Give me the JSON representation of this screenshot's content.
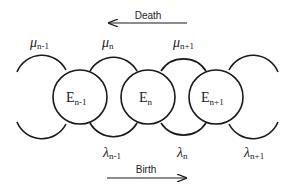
{
  "diagram": {
    "colors": {
      "stroke": "#1a1a1a",
      "text": "#222222",
      "background": "#ffffff"
    },
    "death_arrow": {
      "label": "Death",
      "direction": "left"
    },
    "birth_arrow": {
      "label": "Birth",
      "direction": "right"
    },
    "states": [
      {
        "base": "E",
        "sub": "n-1"
      },
      {
        "base": "E",
        "sub": "n"
      },
      {
        "base": "E",
        "sub": "n+1"
      }
    ],
    "death_rates": [
      {
        "symbol": "μ",
        "sub": "n-1"
      },
      {
        "symbol": "μ",
        "sub": "n"
      },
      {
        "symbol": "μ",
        "sub": "n+1"
      }
    ],
    "birth_rates": [
      {
        "symbol": "λ",
        "sub": "n-1"
      },
      {
        "symbol": "λ",
        "sub": "n"
      },
      {
        "symbol": "λ",
        "sub": "n+1"
      }
    ]
  }
}
